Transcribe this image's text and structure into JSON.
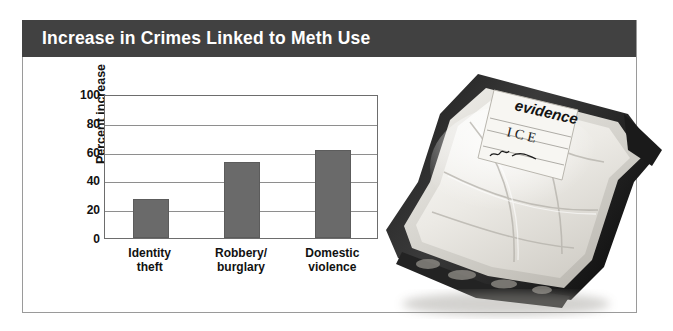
{
  "figure": {
    "title": "Increase in Crimes Linked to Meth Use",
    "banner_color": "#414141",
    "frame_color": "#9a9a9a"
  },
  "chart_data": {
    "type": "bar",
    "title": "Increase in Crimes Linked to Meth Use",
    "categories": [
      "Identity theft",
      "Robbery/burglary",
      "Domestic violence"
    ],
    "category_lines": [
      [
        "Identity",
        "theft"
      ],
      [
        "Robbery/",
        "burglary"
      ],
      [
        "Domestic",
        "violence"
      ]
    ],
    "values": [
      27,
      53,
      61
    ],
    "xlabel": "",
    "ylabel": "Percent increase",
    "ylim": [
      0,
      100
    ],
    "yticks": [
      0,
      20,
      40,
      60,
      80,
      100
    ],
    "ytick_labels": [
      "0",
      "20",
      "40",
      "60",
      "80",
      "100"
    ],
    "grid": true,
    "legend": false,
    "bar_color": "#6a6a6a"
  },
  "photo": {
    "alt": "Sealed plastic evidence bag containing white crystalline methamphetamine",
    "label_heading": "evidence",
    "label_contents": "I C E",
    "label_signature": "m.f."
  }
}
